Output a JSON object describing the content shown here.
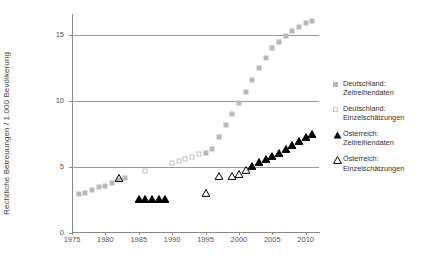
{
  "chart_data": {
    "type": "scatter",
    "title": "",
    "xlabel": "",
    "ylabel": "Rechtliche Betreuungen / 1.000 Bevölkerung",
    "xlim": [
      1975,
      2012
    ],
    "ylim": [
      0,
      16.6
    ],
    "xticks": [
      1975,
      1980,
      1985,
      1990,
      1995,
      2000,
      2005,
      2010
    ],
    "yticks": [
      0,
      5,
      10,
      15
    ],
    "gridlines": [
      5,
      10,
      15
    ],
    "grid": true,
    "legend_position": "right",
    "series": [
      {
        "name": "Deutschland: Zeitreihendaten",
        "marker": "filled-square",
        "color": "#b9b9b9",
        "points": [
          [
            1976,
            2.95
          ],
          [
            1977,
            3.05
          ],
          [
            1978,
            3.25
          ],
          [
            1979,
            3.45
          ],
          [
            1980,
            3.6
          ],
          [
            1981,
            3.8
          ],
          [
            1982,
            4.0
          ],
          [
            1983,
            4.15
          ],
          [
            1995,
            6.05
          ],
          [
            1996,
            6.35
          ],
          [
            1997,
            7.3
          ],
          [
            1998,
            8.15
          ],
          [
            1999,
            9.0
          ],
          [
            2000,
            9.85
          ],
          [
            2001,
            10.7
          ],
          [
            2002,
            11.6
          ],
          [
            2003,
            12.5
          ],
          [
            2004,
            13.3
          ],
          [
            2005,
            14.0
          ],
          [
            2006,
            14.5
          ],
          [
            2007,
            14.9
          ],
          [
            2008,
            15.3
          ],
          [
            2009,
            15.6
          ],
          [
            2010,
            15.9
          ],
          [
            2011,
            16.1
          ]
        ]
      },
      {
        "name": "Deutschland: Einzelschätzungen",
        "marker": "open-square",
        "color": "#c2c2c2",
        "points": [
          [
            1986,
            4.7
          ],
          [
            1990,
            5.3
          ],
          [
            1991,
            5.45
          ],
          [
            1992,
            5.6
          ],
          [
            1993,
            5.75
          ],
          [
            1994,
            6.0
          ]
        ]
      },
      {
        "name": "Österreich: Zeitreihendaten",
        "marker": "filled-triangle",
        "color": "#000000",
        "points": [
          [
            1985,
            2.55
          ],
          [
            1986,
            2.55
          ],
          [
            1987,
            2.6
          ],
          [
            1988,
            2.6
          ],
          [
            1989,
            2.6
          ],
          [
            2002,
            5.1
          ],
          [
            2003,
            5.35
          ],
          [
            2004,
            5.6
          ],
          [
            2005,
            5.85
          ],
          [
            2006,
            6.1
          ],
          [
            2007,
            6.4
          ],
          [
            2008,
            6.7
          ],
          [
            2009,
            7.0
          ],
          [
            2010,
            7.25
          ],
          [
            2011,
            7.5
          ]
        ]
      },
      {
        "name": "Österreich: Einzelschätzungen",
        "marker": "open-triangle",
        "color": "#000000",
        "points": [
          [
            1982,
            4.2
          ],
          [
            1995,
            3.0
          ],
          [
            1997,
            4.35
          ],
          [
            1999,
            4.35
          ],
          [
            2000,
            4.5
          ],
          [
            2001,
            4.8
          ]
        ]
      }
    ]
  },
  "axis": {
    "ylabel": "Rechtliche Betreuungen / 1.000 Bevölkerung",
    "ytick_labels": [
      "0",
      "5",
      "10",
      "15"
    ],
    "xtick_labels": [
      "1975",
      "1980",
      "1985",
      "1990",
      "1995",
      "2000",
      "2005",
      "2010"
    ]
  },
  "legend": {
    "items": [
      {
        "marker": "filled-square",
        "line1": "Deutschland:",
        "line2": "Zeitreihendaten"
      },
      {
        "marker": "open-square",
        "line1": "Deutschland:",
        "line2": "Einzelschätzungen"
      },
      {
        "marker": "filled-triangle",
        "line1": "Österreich:",
        "line2": "Zeitreihendaten"
      },
      {
        "marker": "open-triangle",
        "line1": "Österreich:",
        "line2": "Einzelschätzungen"
      }
    ]
  }
}
